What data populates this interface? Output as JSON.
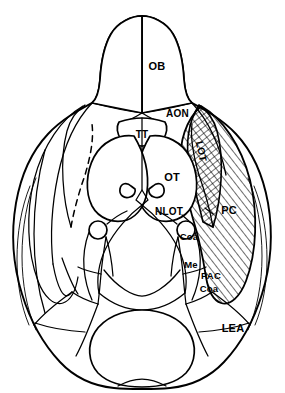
{
  "figure": {
    "view": "ventral",
    "background_color": "#ffffff",
    "line_color": "#000000"
  },
  "labels": {
    "ob": "OB",
    "aon": "AON",
    "tt": "TT",
    "lot": "LOT",
    "ot": "OT",
    "nlot": "NLOT",
    "pc": "PC",
    "coa_upper": "Coa",
    "me": "Me",
    "pac": "PAC",
    "coa_lower": "Coa",
    "lea": "LEA"
  },
  "regions": [
    {
      "key": "ob",
      "abbr": "OB",
      "name": "olfactory-bulb",
      "shaded": false,
      "hatch": "none"
    },
    {
      "key": "aon",
      "abbr": "AON",
      "name": "anterior-olfactory-nucleus",
      "shaded": false,
      "hatch": "none"
    },
    {
      "key": "tt",
      "abbr": "TT",
      "name": "tenia-tecta",
      "shaded": false,
      "hatch": "none"
    },
    {
      "key": "lot",
      "abbr": "LOT",
      "name": "lateral-olfactory-tract",
      "shaded": true,
      "hatch": "cross"
    },
    {
      "key": "ot",
      "abbr": "OT",
      "name": "olfactory-tubercle",
      "shaded": false,
      "hatch": "none"
    },
    {
      "key": "nlot",
      "abbr": "NLOT",
      "name": "nucleus-of-lateral-olfactory-tract",
      "shaded": false,
      "hatch": "none"
    },
    {
      "key": "pc",
      "abbr": "PC",
      "name": "piriform-cortex",
      "shaded": true,
      "hatch": "diagonal"
    },
    {
      "key": "coa_upper",
      "abbr": "Coa",
      "name": "cortical-amygdaloid-nucleus-anterior",
      "shaded": false,
      "hatch": "none"
    },
    {
      "key": "me",
      "abbr": "Me",
      "name": "medial-amygdaloid-nucleus",
      "shaded": false,
      "hatch": "none"
    },
    {
      "key": "pac",
      "abbr": "PAC",
      "name": "periamygdaloid-cortex",
      "shaded": false,
      "hatch": "none"
    },
    {
      "key": "coa_lower",
      "abbr": "Coa",
      "name": "cortical-amygdaloid-nucleus-posterior",
      "shaded": false,
      "hatch": "none"
    },
    {
      "key": "lea",
      "abbr": "LEA",
      "name": "lateral-entorhinal-area",
      "shaded": false,
      "hatch": "none"
    }
  ]
}
